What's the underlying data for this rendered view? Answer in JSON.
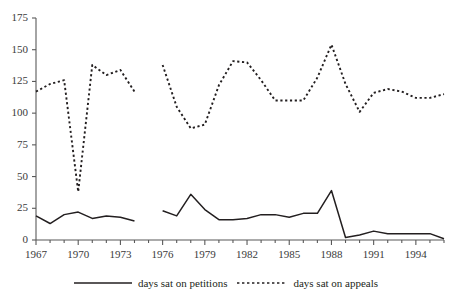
{
  "chart_data": {
    "type": "line",
    "title": "",
    "xlabel": "",
    "ylabel": "",
    "xlim": [
      1967,
      1996
    ],
    "ylim": [
      0,
      175
    ],
    "yticks": [
      0,
      25,
      50,
      75,
      100,
      125,
      150,
      175
    ],
    "xticks": [
      1967,
      1970,
      1973,
      1976,
      1979,
      1982,
      1985,
      1988,
      1991,
      1994
    ],
    "grid": false,
    "legend_position": "bottom-center",
    "x": [
      1967,
      1968,
      1969,
      1970,
      1971,
      1972,
      1973,
      1974,
      1975,
      1976,
      1977,
      1978,
      1979,
      1980,
      1981,
      1982,
      1983,
      1984,
      1985,
      1986,
      1987,
      1988,
      1989,
      1990,
      1991,
      1992,
      1993,
      1994,
      1995,
      1996
    ],
    "series": [
      {
        "name": "days sat on petitions",
        "style": "solid",
        "color": "#231f20",
        "values": [
          19,
          13,
          20,
          22,
          17,
          19,
          18,
          15,
          null,
          23,
          19,
          36,
          24,
          16,
          16,
          17,
          20,
          20,
          18,
          21,
          21,
          39,
          2,
          4,
          7,
          5,
          5,
          5,
          5,
          1
        ]
      },
      {
        "name": "days sat on appeals",
        "style": "dotted",
        "color": "#231f20",
        "values": [
          117,
          123,
          126,
          38,
          138,
          130,
          134,
          117,
          null,
          138,
          105,
          88,
          91,
          122,
          141,
          140,
          126,
          110,
          110,
          110,
          128,
          154,
          123,
          101,
          116,
          119,
          117,
          112,
          112,
          115
        ]
      }
    ]
  },
  "legend": {
    "entries": [
      {
        "label": "days sat on petitions",
        "style": "solid"
      },
      {
        "label": "days sat on appeals",
        "style": "dotted"
      }
    ]
  }
}
